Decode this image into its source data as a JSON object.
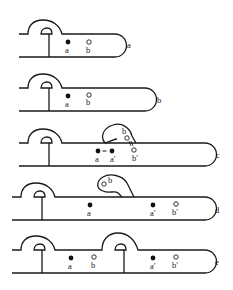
{
  "figure": {
    "caption": "",
    "panels": [
      {
        "id": "a",
        "label": "a",
        "points": [
          {
            "name": "a",
            "type": "filled"
          },
          {
            "name": "b",
            "type": "open"
          }
        ]
      },
      {
        "id": "b",
        "label": "b",
        "points": [
          {
            "name": "a",
            "type": "filled"
          },
          {
            "name": "b",
            "type": "open"
          }
        ]
      },
      {
        "id": "c",
        "label": "c",
        "points": [
          {
            "name": "a",
            "type": "filled"
          },
          {
            "name": "a′",
            "type": "filled"
          },
          {
            "name": "b",
            "type": "open"
          },
          {
            "name": "b′",
            "type": "open"
          }
        ],
        "link_symbol": "="
      },
      {
        "id": "d",
        "label": "d",
        "points": [
          {
            "name": "a",
            "type": "filled"
          },
          {
            "name": "b",
            "type": "open"
          },
          {
            "name": "a′",
            "type": "filled"
          },
          {
            "name": "b′",
            "type": "open"
          }
        ]
      },
      {
        "id": "e",
        "label": "e",
        "points": [
          {
            "name": "a",
            "type": "filled"
          },
          {
            "name": "b",
            "type": "open"
          },
          {
            "name": "a′",
            "type": "filled"
          },
          {
            "name": "b′",
            "type": "open"
          }
        ]
      }
    ]
  }
}
